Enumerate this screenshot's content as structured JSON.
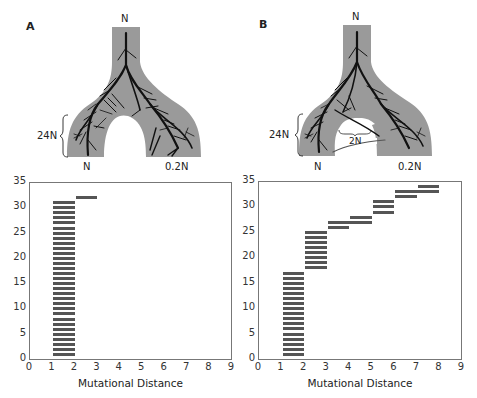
{
  "panels": [
    {
      "id": "A",
      "label": "A",
      "diagram": {
        "top_label": "N",
        "left_label": "N",
        "right_label": "0.2N",
        "bracket_label": "24N",
        "migration_label": null
      }
    },
    {
      "id": "B",
      "label": "B",
      "diagram": {
        "top_label": "N",
        "left_label": "N",
        "right_label": "0.2N",
        "bracket_label": "24N",
        "migration_label": "2N"
      }
    }
  ],
  "colors": {
    "population_fill": "#9a9a9a",
    "lineage": "#111111",
    "bar": "#555555",
    "axis": "#777777"
  },
  "chart_data": [
    {
      "type": "bar",
      "subtype": "horizontal-range-segments",
      "panel": "A",
      "title": "",
      "xlabel": "Mutational Distance",
      "ylabel": "",
      "xlim": [
        0,
        9
      ],
      "ylim": [
        0,
        35
      ],
      "xticks": [
        "0",
        "1",
        "2",
        "3",
        "4",
        "5",
        "6",
        "7",
        "8",
        "9"
      ],
      "yticks": [
        "0",
        "5",
        "10",
        "15",
        "20",
        "25",
        "30",
        "35"
      ],
      "grid": false,
      "legend": null,
      "segments": [
        {
          "y": 1,
          "x0": 1,
          "x1": 2
        },
        {
          "y": 2,
          "x0": 1,
          "x1": 2
        },
        {
          "y": 3,
          "x0": 1,
          "x1": 2
        },
        {
          "y": 4,
          "x0": 1,
          "x1": 2
        },
        {
          "y": 5,
          "x0": 1,
          "x1": 2
        },
        {
          "y": 6,
          "x0": 1,
          "x1": 2
        },
        {
          "y": 7,
          "x0": 1,
          "x1": 2
        },
        {
          "y": 8,
          "x0": 1,
          "x1": 2
        },
        {
          "y": 9,
          "x0": 1,
          "x1": 2
        },
        {
          "y": 10,
          "x0": 1,
          "x1": 2
        },
        {
          "y": 11,
          "x0": 1,
          "x1": 2
        },
        {
          "y": 12,
          "x0": 1,
          "x1": 2
        },
        {
          "y": 13,
          "x0": 1,
          "x1": 2
        },
        {
          "y": 14,
          "x0": 1,
          "x1": 2
        },
        {
          "y": 15,
          "x0": 1,
          "x1": 2
        },
        {
          "y": 16,
          "x0": 1,
          "x1": 2
        },
        {
          "y": 17,
          "x0": 1,
          "x1": 2
        },
        {
          "y": 18,
          "x0": 1,
          "x1": 2
        },
        {
          "y": 19,
          "x0": 1,
          "x1": 2
        },
        {
          "y": 20,
          "x0": 1,
          "x1": 2
        },
        {
          "y": 21,
          "x0": 1,
          "x1": 2
        },
        {
          "y": 22,
          "x0": 1,
          "x1": 2
        },
        {
          "y": 23,
          "x0": 1,
          "x1": 2
        },
        {
          "y": 24,
          "x0": 1,
          "x1": 2
        },
        {
          "y": 25,
          "x0": 1,
          "x1": 2
        },
        {
          "y": 26,
          "x0": 1,
          "x1": 2
        },
        {
          "y": 27,
          "x0": 1,
          "x1": 2
        },
        {
          "y": 28,
          "x0": 1,
          "x1": 2
        },
        {
          "y": 29,
          "x0": 1,
          "x1": 2
        },
        {
          "y": 30,
          "x0": 1,
          "x1": 2
        },
        {
          "y": 31,
          "x0": 1,
          "x1": 2
        },
        {
          "y": 32,
          "x0": 2,
          "x1": 3
        }
      ]
    },
    {
      "type": "bar",
      "subtype": "horizontal-range-segments",
      "panel": "B",
      "title": "",
      "xlabel": "Mutational Distance",
      "ylabel": "",
      "xlim": [
        0,
        9
      ],
      "ylim": [
        0,
        35
      ],
      "xticks": [
        "0",
        "1",
        "2",
        "3",
        "4",
        "5",
        "6",
        "7",
        "8",
        "9"
      ],
      "yticks": [
        "0",
        "5",
        "10",
        "15",
        "20",
        "25",
        "30",
        "35"
      ],
      "grid": false,
      "legend": null,
      "segments": [
        {
          "y": 1,
          "x0": 1,
          "x1": 2
        },
        {
          "y": 2,
          "x0": 1,
          "x1": 2
        },
        {
          "y": 3,
          "x0": 1,
          "x1": 2
        },
        {
          "y": 4,
          "x0": 1,
          "x1": 2
        },
        {
          "y": 5,
          "x0": 1,
          "x1": 2
        },
        {
          "y": 6,
          "x0": 1,
          "x1": 2
        },
        {
          "y": 7,
          "x0": 1,
          "x1": 2
        },
        {
          "y": 8,
          "x0": 1,
          "x1": 2
        },
        {
          "y": 9,
          "x0": 1,
          "x1": 2
        },
        {
          "y": 10,
          "x0": 1,
          "x1": 2
        },
        {
          "y": 11,
          "x0": 1,
          "x1": 2
        },
        {
          "y": 12,
          "x0": 1,
          "x1": 2
        },
        {
          "y": 13,
          "x0": 1,
          "x1": 2
        },
        {
          "y": 14,
          "x0": 1,
          "x1": 2
        },
        {
          "y": 15,
          "x0": 1,
          "x1": 2
        },
        {
          "y": 16,
          "x0": 1,
          "x1": 2
        },
        {
          "y": 17,
          "x0": 1,
          "x1": 2
        },
        {
          "y": 18,
          "x0": 2,
          "x1": 3
        },
        {
          "y": 19,
          "x0": 2,
          "x1": 3
        },
        {
          "y": 20,
          "x0": 2,
          "x1": 3
        },
        {
          "y": 21,
          "x0": 2,
          "x1": 3
        },
        {
          "y": 22,
          "x0": 2,
          "x1": 3
        },
        {
          "y": 23,
          "x0": 2,
          "x1": 3
        },
        {
          "y": 24,
          "x0": 2,
          "x1": 3
        },
        {
          "y": 25,
          "x0": 2,
          "x1": 3
        },
        {
          "y": 26,
          "x0": 3,
          "x1": 4
        },
        {
          "y": 27,
          "x0": 3,
          "x1": 5
        },
        {
          "y": 28,
          "x0": 4,
          "x1": 5
        },
        {
          "y": 29,
          "x0": 5,
          "x1": 6
        },
        {
          "y": 30,
          "x0": 5,
          "x1": 6
        },
        {
          "y": 31,
          "x0": 5,
          "x1": 6
        },
        {
          "y": 32,
          "x0": 6,
          "x1": 7
        },
        {
          "y": 33,
          "x0": 6,
          "x1": 8
        },
        {
          "y": 34,
          "x0": 7,
          "x1": 8
        }
      ]
    }
  ]
}
